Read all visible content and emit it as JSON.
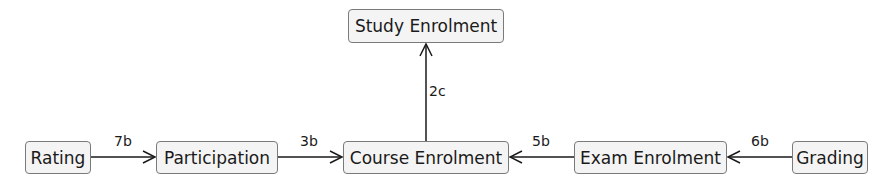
{
  "nodes": {
    "study_enrolment": "Study Enrolment",
    "rating": "Rating",
    "participation": "Participation",
    "course_enrolment": "Course Enrolment",
    "exam_enrolment": "Exam Enrolment",
    "grading": "Grading"
  },
  "edges": [
    {
      "from": "Rating",
      "to": "Participation",
      "label": "7b"
    },
    {
      "from": "Participation",
      "to": "Course Enrolment",
      "label": "3b"
    },
    {
      "from": "Course Enrolment",
      "to": "Study Enrolment",
      "label": "2c"
    },
    {
      "from": "Exam Enrolment",
      "to": "Course Enrolment",
      "label": "5b"
    },
    {
      "from": "Grading",
      "to": "Exam Enrolment",
      "label": "6b"
    }
  ],
  "colors": {
    "border": "#7a7a7a",
    "fill": "#f4f4f4",
    "line": "#1a1a1a"
  }
}
